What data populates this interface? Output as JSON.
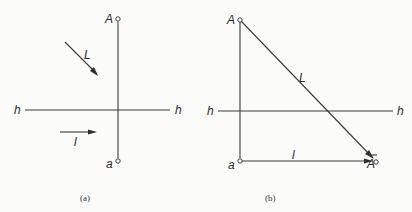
{
  "figure": {
    "type": "descriptive-geometry projection diagram",
    "panels": [
      {
        "id": "a",
        "caption": "(a)",
        "labels": {
          "point_upper": "A",
          "point_lower": "a",
          "axis_left": "h",
          "axis_right": "h",
          "direction_upper": "L",
          "direction_lower": "l"
        },
        "elements": {
          "vertical_line": "A to a",
          "axis": "h-h horizontal",
          "arrow_L": "diagonal direction arrow (down-right)",
          "arrow_l": "horizontal direction arrow (right)"
        }
      },
      {
        "id": "b",
        "caption": "(b)",
        "labels": {
          "point_upper": "A",
          "point_lower": "a",
          "point_shadow": "A",
          "axis_left": "h",
          "axis_right": "h",
          "hypotenuse": "L",
          "base": "l"
        },
        "elements": {
          "vertical_line": "A to a",
          "axis": "h-h horizontal",
          "hypotenuse": "A to Ā with arrow",
          "base": "a to Ā with arrow"
        }
      }
    ],
    "colors": {
      "line": "#3a3a3a",
      "text": "#2a2a2a",
      "background": "#fbfbfa"
    }
  }
}
